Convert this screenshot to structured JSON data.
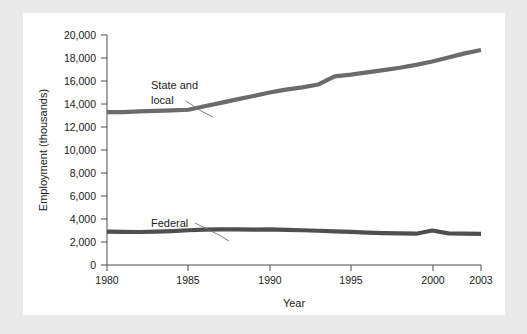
{
  "figure": {
    "background_color": "#e9e9e9",
    "panel_color": "#ffffff"
  },
  "chart_data": {
    "type": "line",
    "title": "",
    "xlabel": "Year",
    "ylabel": "Employment (thousands)",
    "xlim": [
      1980,
      2003
    ],
    "ylim": [
      0,
      20000
    ],
    "xticks": [
      "1980",
      "1985",
      "1990",
      "1995",
      "2000",
      "2003"
    ],
    "xtick_values": [
      1980,
      1985,
      1990,
      1995,
      2000,
      2003
    ],
    "yticks": [
      "0",
      "2,000",
      "4,000",
      "6,000",
      "8,000",
      "10,000",
      "12,000",
      "14,000",
      "16,000",
      "18,000",
      "20,000"
    ],
    "ytick_values": [
      0,
      2000,
      4000,
      6000,
      8000,
      10000,
      12000,
      14000,
      16000,
      18000,
      20000
    ],
    "grid": false,
    "legend_position": "inline-annotations",
    "line_color": "#6b6b6b",
    "series": [
      {
        "name": "State and local",
        "label_line1": "State and",
        "label_line2": "local",
        "color": "#6b6b6b",
        "x": [
          1980,
          1981,
          1982,
          1983,
          1984,
          1985,
          1986,
          1987,
          1988,
          1989,
          1990,
          1991,
          1992,
          1993,
          1994,
          1995,
          1996,
          1997,
          1998,
          1999,
          2000,
          2001,
          2002,
          2003
        ],
        "values": [
          13300,
          13300,
          13350,
          13400,
          13450,
          13500,
          13800,
          14100,
          14400,
          14700,
          15000,
          15250,
          15450,
          15700,
          16400,
          16550,
          16750,
          16950,
          17150,
          17400,
          17700,
          18050,
          18400,
          18700
        ]
      },
      {
        "name": "Federal",
        "label_line1": "Federal",
        "label_line2": "",
        "color": "#4f4f4f",
        "x": [
          1980,
          1981,
          1982,
          1983,
          1984,
          1985,
          1986,
          1987,
          1988,
          1989,
          1990,
          1991,
          1992,
          1993,
          1994,
          1995,
          1996,
          1997,
          1998,
          1999,
          2000,
          2001,
          2002,
          2003
        ],
        "values": [
          2900,
          2880,
          2870,
          2900,
          2950,
          3020,
          3080,
          3100,
          3090,
          3080,
          3090,
          3060,
          3020,
          2980,
          2930,
          2880,
          2820,
          2780,
          2750,
          2720,
          3000,
          2750,
          2720,
          2700
        ]
      }
    ],
    "annotations": [
      {
        "name": "state-and-local",
        "text_line1": "State and",
        "text_line2": "local",
        "points_to_year": 1985,
        "points_to_value": 13500
      },
      {
        "name": "federal",
        "text_line1": "Federal",
        "text_line2": "",
        "points_to_year": 1986,
        "points_to_value": 3080
      }
    ]
  }
}
